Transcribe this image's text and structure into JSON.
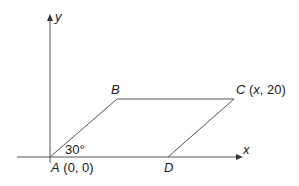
{
  "diagram": {
    "type": "parallelogram-on-coordinate-axes",
    "axes": {
      "x_label": "x",
      "y_label": "y"
    },
    "vertices": [
      {
        "name": "A",
        "coords_label": "(0, 0)"
      },
      {
        "name": "B",
        "coords_label": ""
      },
      {
        "name": "C",
        "coords_label": "(x, 20)",
        "coord_x": "x",
        "coord_y": "20"
      },
      {
        "name": "D",
        "coords_label": ""
      }
    ],
    "angle": {
      "at": "A",
      "label": "30°"
    },
    "colors": {
      "line": "#555555",
      "text": "#1a1a1a",
      "background": "#ffffff"
    }
  }
}
